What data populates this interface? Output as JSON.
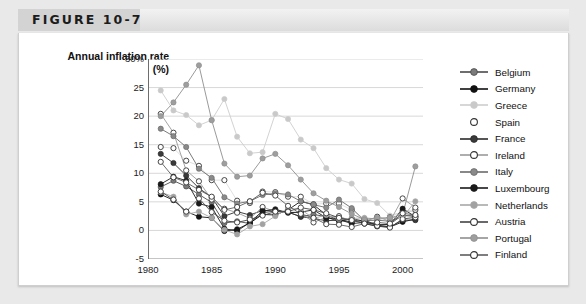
{
  "figure": {
    "label": "FIGURE 10-7"
  },
  "chart_data": {
    "type": "line",
    "title": "Annual inflation rate (%)",
    "title_line1": "Annual inflation rate",
    "title_line2": "(%)",
    "xlabel": "",
    "ylabel": "Annual inflation rate (%)",
    "xlim": [
      1980,
      2001.6
    ],
    "ylim": [
      -5,
      30
    ],
    "grid": true,
    "legend_position": "right",
    "ytick_labels": [
      "30%",
      "25",
      "20",
      "15",
      "10",
      "5",
      "0",
      "-5"
    ],
    "ytick_values": [
      30,
      25,
      20,
      15,
      10,
      5,
      0,
      -5
    ],
    "xtick_labels": [
      "1980",
      "1985",
      "1990",
      "1995",
      "2000"
    ],
    "xtick_values": [
      1980,
      1985,
      1990,
      1995,
      2000
    ],
    "x": [
      1981,
      1982,
      1983,
      1984,
      1985,
      1986,
      1987,
      1988,
      1989,
      1990,
      1991,
      1992,
      1993,
      1994,
      1995,
      1996,
      1997,
      1998,
      1999,
      2000,
      2001
    ],
    "series": [
      {
        "name": "Belgium",
        "marker": "filled-gray",
        "color": "#7b7b7b",
        "line_color": "#4a4a4a",
        "values": [
          7.6,
          8.7,
          7.7,
          6.3,
          4.9,
          1.3,
          1.6,
          1.2,
          3.1,
          3.4,
          3.2,
          2.4,
          2.8,
          2.4,
          1.5,
          2.1,
          1.6,
          0.9,
          1.1,
          2.7,
          2.4
        ]
      },
      {
        "name": "Germany",
        "marker": "filled-black",
        "color": "#111111",
        "line_color": "#111111",
        "values": [
          6.3,
          5.3,
          3.3,
          2.4,
          2.2,
          -0.1,
          0.2,
          1.3,
          2.8,
          2.7,
          3.6,
          5.1,
          4.5,
          2.7,
          1.8,
          1.5,
          1.8,
          0.9,
          0.6,
          1.5,
          2.0
        ]
      },
      {
        "name": "Greece",
        "marker": "filled-lightgray",
        "color": "#c9c9c9",
        "line_color": "#cdcdcd",
        "values": [
          24.5,
          21.0,
          20.2,
          18.4,
          19.3,
          23.0,
          16.4,
          13.5,
          13.7,
          20.4,
          19.5,
          15.9,
          14.4,
          10.9,
          8.9,
          8.2,
          5.5,
          4.8,
          2.6,
          3.2,
          3.4
        ]
      },
      {
        "name": "Spain",
        "marker": "hollow",
        "color": "#ffffff",
        "line_color": "#dcdcdc",
        "values": [
          14.6,
          14.4,
          12.2,
          11.3,
          8.8,
          8.8,
          5.2,
          4.8,
          6.8,
          6.7,
          5.9,
          5.9,
          4.6,
          4.7,
          4.7,
          3.6,
          2.0,
          1.8,
          2.3,
          3.4,
          3.6
        ]
      },
      {
        "name": "France",
        "marker": "filled-darkgray",
        "color": "#3a3a3a",
        "line_color": "#2b2b2b",
        "values": [
          13.4,
          11.8,
          9.6,
          7.4,
          5.8,
          2.5,
          3.3,
          2.7,
          3.5,
          3.4,
          3.2,
          2.4,
          2.1,
          1.7,
          1.8,
          2.0,
          1.2,
          0.7,
          0.6,
          1.8,
          1.8
        ]
      },
      {
        "name": "Ireland",
        "marker": "hollow",
        "color": "#ffffff",
        "line_color": "#9a9a9a",
        "values": [
          20.4,
          17.1,
          10.5,
          8.6,
          5.4,
          3.8,
          3.1,
          2.1,
          4.1,
          3.3,
          3.2,
          3.1,
          1.4,
          2.3,
          2.5,
          1.6,
          1.5,
          2.4,
          1.6,
          5.6,
          4.0
        ]
      },
      {
        "name": "Italy",
        "marker": "filled-gray",
        "color": "#8a8a8a",
        "line_color": "#6b6b6b",
        "values": [
          17.8,
          16.5,
          14.6,
          10.8,
          9.2,
          5.8,
          4.7,
          5.1,
          6.2,
          6.5,
          6.3,
          5.1,
          4.5,
          4.0,
          5.4,
          3.9,
          1.7,
          1.8,
          1.6,
          2.5,
          2.7
        ]
      },
      {
        "name": "Luxembourg",
        "marker": "filled-black",
        "color": "#1a1a1a",
        "line_color": "#1a1a1a",
        "values": [
          8.1,
          9.4,
          8.7,
          4.7,
          4.1,
          0.3,
          -0.1,
          1.4,
          3.4,
          3.7,
          3.1,
          3.2,
          3.6,
          2.2,
          1.9,
          1.2,
          1.4,
          1.0,
          1.0,
          3.8,
          2.4
        ]
      },
      {
        "name": "Netherlands",
        "marker": "filled-midgray",
        "color": "#a2a2a2",
        "line_color": "#a8a8a8",
        "values": [
          6.7,
          5.9,
          2.8,
          3.3,
          2.2,
          0.1,
          -0.7,
          0.7,
          1.1,
          2.5,
          3.9,
          3.7,
          2.1,
          2.7,
          2.0,
          2.1,
          2.2,
          2.0,
          2.2,
          2.3,
          5.1
        ]
      },
      {
        "name": "Austria",
        "marker": "hollow",
        "color": "#ffffff",
        "line_color": "#444444",
        "values": [
          6.8,
          5.4,
          3.3,
          5.6,
          3.2,
          1.7,
          1.4,
          1.9,
          2.6,
          3.3,
          3.3,
          4.0,
          3.6,
          3.0,
          2.2,
          1.8,
          1.2,
          0.8,
          0.5,
          2.0,
          2.3
        ]
      },
      {
        "name": "Portugal",
        "marker": "filled-midgray",
        "color": "#9e9e9e",
        "line_color": "#8f8f8f",
        "values": [
          20.0,
          22.4,
          25.5,
          28.9,
          19.3,
          11.7,
          9.4,
          9.6,
          12.6,
          13.4,
          11.4,
          8.9,
          6.5,
          5.2,
          4.1,
          2.9,
          1.9,
          2.2,
          2.2,
          2.8,
          11.2
        ]
      },
      {
        "name": "Finland",
        "marker": "hollow",
        "color": "#ffffff",
        "line_color": "#5e5e5e",
        "values": [
          12.0,
          9.3,
          8.4,
          7.1,
          5.9,
          3.6,
          4.1,
          5.1,
          6.6,
          6.1,
          4.3,
          2.9,
          2.2,
          1.1,
          1.0,
          0.6,
          1.2,
          1.4,
          1.2,
          3.0,
          2.7
        ]
      }
    ]
  }
}
